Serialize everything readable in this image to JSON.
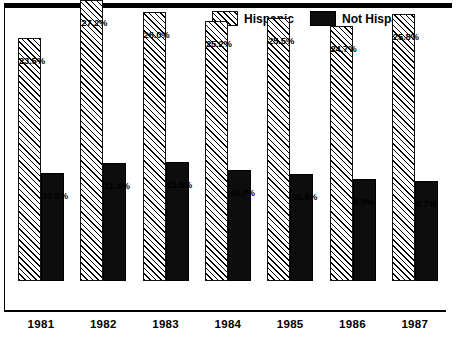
{
  "chart_data": {
    "type": "bar",
    "title": "",
    "subtitle": "",
    "xlabel": "",
    "ylabel": "",
    "ylim": [
      0,
      27.2
    ],
    "grid": false,
    "legend_position": "top-center",
    "categories": [
      "1981",
      "1982",
      "1983",
      "1984",
      "1985",
      "1986",
      "1987"
    ],
    "series": [
      {
        "name": "Hispanic",
        "fill": "diagonal-hatch",
        "color": "#ffffff",
        "values": [
          23.5,
          27.2,
          26.0,
          25.2,
          25.5,
          24.7,
          25.8
        ],
        "labels": [
          "23.5%",
          "27.2%",
          "26.0%",
          "25.2%",
          "25.5%",
          "24.7%",
          "25.8%"
        ]
      },
      {
        "name": "Not Hispanic",
        "fill": "solid",
        "color": "#0d0d0d",
        "values": [
          10.5,
          11.4,
          11.5,
          10.7,
          10.4,
          9.9,
          9.7
        ],
        "labels": [
          "10.5%",
          "11.4%",
          "11.5%",
          "10.7%",
          "10.4%",
          "9.9%",
          "9.7%"
        ]
      }
    ]
  },
  "legend": {
    "items": [
      {
        "label": "Hispanic",
        "swatch": "hatched-swatch"
      },
      {
        "label": "Not Hispanic",
        "swatch": "solid-black-swatch"
      }
    ]
  }
}
